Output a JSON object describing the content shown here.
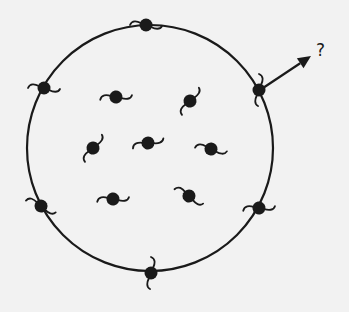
{
  "diagram": {
    "colors": {
      "background": "#f2f2f2",
      "ink": "#1a1a1a"
    },
    "circle": {
      "cx": 150,
      "cy": 148,
      "r": 123
    },
    "boundary_particles": [
      {
        "x": 146,
        "y": 25,
        "angle": 0
      },
      {
        "x": 44,
        "y": 88,
        "angle": 0
      },
      {
        "x": 259,
        "y": 90,
        "angle": 90
      },
      {
        "x": 41,
        "y": 206,
        "angle": 20
      },
      {
        "x": 259,
        "y": 208,
        "angle": -10
      },
      {
        "x": 151,
        "y": 273,
        "angle": 90
      }
    ],
    "interior_particles": [
      {
        "x": 116,
        "y": 97,
        "angle": -10
      },
      {
        "x": 190,
        "y": 101,
        "angle": -60
      },
      {
        "x": 93,
        "y": 148,
        "angle": -60
      },
      {
        "x": 148,
        "y": 143,
        "angle": -20
      },
      {
        "x": 211,
        "y": 149,
        "angle": 5
      },
      {
        "x": 113,
        "y": 199,
        "angle": -10
      },
      {
        "x": 189,
        "y": 196,
        "angle": 25
      }
    ],
    "arrow": {
      "x1": 263,
      "y1": 88,
      "x2": 311,
      "y2": 56
    },
    "label": "?"
  }
}
